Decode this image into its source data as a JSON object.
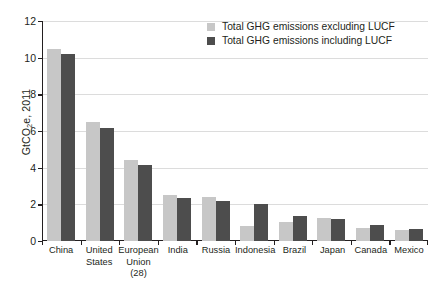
{
  "chart_data": {
    "type": "bar",
    "title": "",
    "xlabel": "",
    "ylabel": "GtCO2e, 2011",
    "ylabel_parts": {
      "pre": "GtCO",
      "sub": "2",
      "post": "e, 2011"
    },
    "ylim": [
      0,
      12
    ],
    "yticks": [
      0,
      2,
      4,
      6,
      8,
      10,
      12
    ],
    "ytick_labels": [
      "0",
      "2",
      "4",
      "6",
      "8",
      "10",
      "12"
    ],
    "grid": true,
    "grid_axis": "y",
    "legend_position": "top-right",
    "categories": [
      "China",
      "United States",
      "European Union (28)",
      "India",
      "Russia",
      "Indonesia",
      "Brazil",
      "Japan",
      "Canada",
      "Mexico"
    ],
    "category_lines": [
      [
        "China"
      ],
      [
        "United",
        "States"
      ],
      [
        "European",
        "Union (28)"
      ],
      [
        "India"
      ],
      [
        "Russia"
      ],
      [
        "Indonesia"
      ],
      [
        "Brazil"
      ],
      [
        "Japan"
      ],
      [
        "Canada"
      ],
      [
        "Mexico"
      ]
    ],
    "series": [
      {
        "name": "Total GHG emissions excluding LUCF",
        "color": "#c7c7c7",
        "values": [
          10.5,
          6.5,
          4.4,
          2.5,
          2.4,
          0.8,
          1.05,
          1.25,
          0.7,
          0.6
        ]
      },
      {
        "name": "Total GHG emissions including LUCF",
        "color": "#4d4d4d",
        "values": [
          10.2,
          6.15,
          4.15,
          2.35,
          2.2,
          2.0,
          1.35,
          1.2,
          0.85,
          0.65
        ]
      }
    ]
  },
  "legend": {
    "items": [
      {
        "label": "Total GHG emissions excluding LUCF",
        "swatch": "excl"
      },
      {
        "label": "Total GHG emissions including LUCF",
        "swatch": "incl"
      }
    ]
  },
  "colors": {
    "excluding_lucf": "#c7c7c7",
    "including_lucf": "#4d4d4d",
    "axis": "#231f20",
    "gridline": "#dcdcdc",
    "background": "#ffffff"
  }
}
